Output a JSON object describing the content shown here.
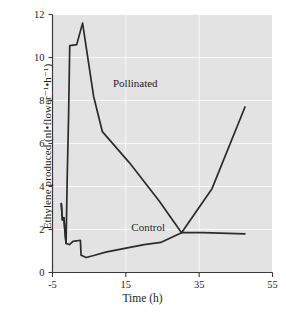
{
  "chart_data": {
    "type": "line",
    "title": "",
    "xlabel": "Time (h)",
    "ylabel": "Ethylene produced (nl•flower⁻¹•h⁻¹)",
    "xlim": [
      -5,
      55
    ],
    "ylim": [
      0,
      12
    ],
    "xticks": [
      "-5",
      "15",
      "35",
      "55"
    ],
    "xtick_values": [
      -5,
      15,
      35,
      55
    ],
    "yticks": [
      "0",
      "2",
      "4",
      "6",
      "8",
      "10",
      "12"
    ],
    "ytick_values": [
      0,
      2,
      4,
      6,
      8,
      10,
      12
    ],
    "grid": true,
    "grid_color": "#ffffff",
    "plot_bg": "#e3e3e3",
    "line_color": "#2b2b2b",
    "legend": "inline-labels",
    "series": [
      {
        "name": "Pollinated",
        "label_x": 11.5,
        "label_y": 8.75,
        "points": [
          [
            -2.6,
            3.2
          ],
          [
            -2.3,
            2.45
          ],
          [
            -1.9,
            2.55
          ],
          [
            -1.6,
            1.9
          ],
          [
            -1.3,
            1.35
          ],
          [
            -1.0,
            4.3
          ],
          [
            -0.6,
            7.4
          ],
          [
            -0.3,
            10.55
          ],
          [
            1.6,
            10.6
          ],
          [
            3.2,
            11.6
          ],
          [
            6.2,
            8.2
          ],
          [
            8.6,
            6.55
          ],
          [
            16.0,
            5.1
          ],
          [
            24.0,
            3.35
          ],
          [
            30.2,
            1.85
          ],
          [
            38.5,
            3.9
          ],
          [
            47.5,
            7.7
          ]
        ]
      },
      {
        "name": "Control",
        "label_x": 16.5,
        "label_y": 2.05,
        "points": [
          [
            -2.6,
            3.2
          ],
          [
            -2.3,
            2.45
          ],
          [
            -1.9,
            2.55
          ],
          [
            -1.6,
            1.9
          ],
          [
            -1.3,
            1.35
          ],
          [
            -0.4,
            1.3
          ],
          [
            0.6,
            1.45
          ],
          [
            2.6,
            1.5
          ],
          [
            2.8,
            0.8
          ],
          [
            4.2,
            0.7
          ],
          [
            6.5,
            0.8
          ],
          [
            9.5,
            0.95
          ],
          [
            14.0,
            1.1
          ],
          [
            20.0,
            1.3
          ],
          [
            24.5,
            1.4
          ],
          [
            30.2,
            1.85
          ],
          [
            36.0,
            1.85
          ],
          [
            47.5,
            1.8
          ]
        ]
      }
    ]
  },
  "axes": {
    "y_tick_labels": [
      "12",
      "10",
      "8",
      "6",
      "4",
      "2",
      "0"
    ],
    "x_tick_labels": [
      "-5",
      "15",
      "35",
      "55"
    ]
  },
  "labels": {
    "pollinated": "Pollinated",
    "control": "Control",
    "x_title": "Time (h)",
    "y_title": "Ethylene produced (nl•flower⁻¹•h⁻¹)"
  }
}
